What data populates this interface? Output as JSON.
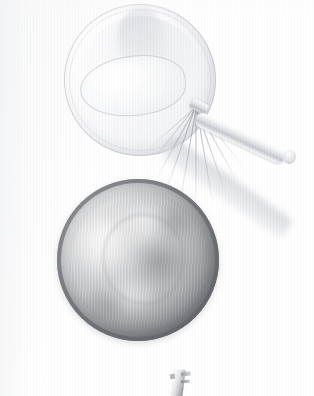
{
  "image": {
    "kind": "photograph",
    "subject": "kitchen utensils on a white surface",
    "treatment": "overexposed / washed-out scan, grayscale",
    "background_color": "#ffffff",
    "width_px": 314,
    "height_px": 396
  },
  "objects": [
    {
      "id": "top-bowl",
      "label": "Faded white mixing bowl (top)",
      "shape": "circle",
      "center_px": [
        140,
        80
      ],
      "diameter_px": 152,
      "tone": "very light, nearly blown-out white",
      "color": "#f3f4f6",
      "rim_color": "#b0b4bc"
    },
    {
      "id": "whisk",
      "label": "Wire balloon whisk resting in the top bowl",
      "cage_center_px": [
        132,
        86
      ],
      "cage_size_px": [
        104,
        58
      ],
      "wire_count": 11,
      "handle_angle_deg": 25,
      "handle_color": "#dcdee2",
      "wire_color": "#8a8f99"
    },
    {
      "id": "handle-shadow",
      "label": "Soft diagonal cast shadow of the whisk handle",
      "angle_deg": 35,
      "color": "#ced1d6"
    },
    {
      "id": "steel-bowl",
      "label": "Stainless steel mixing bowl (bottom), seen from above",
      "shape": "circle",
      "center_px": [
        138,
        260
      ],
      "diameter_px": 162,
      "tone": "mid gray, mottled specular reflections",
      "body_color": "#b9bbbd",
      "rim_color": "#606368",
      "highlight_color": "#f2f2f2"
    },
    {
      "id": "utensil-fragment",
      "label": "Small metal utensil handle at the bottom edge",
      "center_px": [
        180,
        382
      ],
      "size_px": [
        24,
        28
      ],
      "color": "#bfc1c5"
    }
  ],
  "palette": {
    "background": "#ffffff",
    "paper_tint": "#f6f7f8",
    "light_gray": "#e6e7e9",
    "mid_gray": "#b9bbbd",
    "dark_gray": "#77797d",
    "shadow": "#ced1d6"
  }
}
